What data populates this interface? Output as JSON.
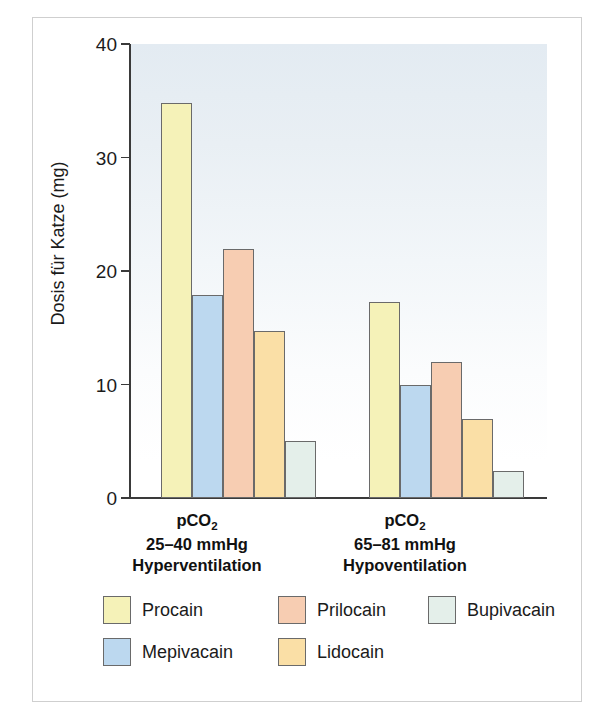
{
  "chart_data": {
    "type": "bar",
    "title": "",
    "subtitle": "",
    "xlabel": "",
    "ylabel": "Dosis für Katze (mg)",
    "ylim": [
      0,
      40
    ],
    "yticks": [
      0,
      10,
      20,
      30,
      40
    ],
    "grid": false,
    "legend_position": "bottom",
    "categories": [
      "pCO2 25–40 mmHg Hyperventilation",
      "pCO2 65–81 mmHg Hypoventilation"
    ],
    "series": [
      {
        "name": "Procain",
        "color": "#f5f2b8",
        "values": [
          34.8,
          17.3
        ]
      },
      {
        "name": "Mepivacain",
        "color": "#bcd8ef",
        "values": [
          17.9,
          10.0
        ]
      },
      {
        "name": "Prilocain",
        "color": "#f7cdb2",
        "values": [
          21.9,
          12.0
        ]
      },
      {
        "name": "Lidocain",
        "color": "#fadfa6",
        "values": [
          14.7,
          7.0
        ]
      },
      {
        "name": "Bupivacain",
        "color": "#e4efea",
        "values": [
          5.0,
          2.4
        ]
      }
    ]
  },
  "axis": {
    "y_title": "Dosis für Katze (mg)",
    "y_tick_labels": [
      "0",
      "10",
      "20",
      "30",
      "40"
    ]
  },
  "x_groups": [
    {
      "line1_main": "pCO",
      "line1_sub": "2",
      "line2": "25–40 mmHg",
      "line3": "Hyperventilation"
    },
    {
      "line1_main": "pCO",
      "line1_sub": "2",
      "line2": "65–81 mmHg",
      "line3": "Hypoventilation"
    }
  ],
  "legend": {
    "items": [
      {
        "label": "Procain",
        "color": "#f5f2b8"
      },
      {
        "label": "Prilocain",
        "color": "#f7cdb2"
      },
      {
        "label": "Bupivacain",
        "color": "#e4efea"
      },
      {
        "label": "Mepivacain",
        "color": "#bcd8ef"
      },
      {
        "label": "Lidocain",
        "color": "#fadfa6"
      }
    ]
  },
  "colors": {
    "axis": "#3a3a3a",
    "frame": "#cfcfcf",
    "bar_outline": "#6a6a6a",
    "background": "#ffffff",
    "plot_wash": "#e3ebf2"
  }
}
